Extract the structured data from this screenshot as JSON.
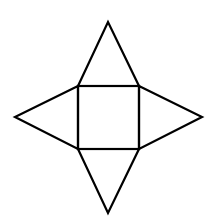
{
  "diagram": {
    "title": "Net of a square pyramid",
    "stroke_color": "#000000",
    "background": "#ffffff",
    "stroke_width": 2.2,
    "square": {
      "x1": 78,
      "y1": 86,
      "x2": 139,
      "y2": 149
    },
    "triangles": {
      "top": {
        "points": "78,86 108,22 139,86"
      },
      "bottom": {
        "points": "78,149 108,213 139,149"
      },
      "left": {
        "points": "78,86 15,117 78,149"
      },
      "right": {
        "points": "139,86 202,117 139,149"
      }
    }
  }
}
